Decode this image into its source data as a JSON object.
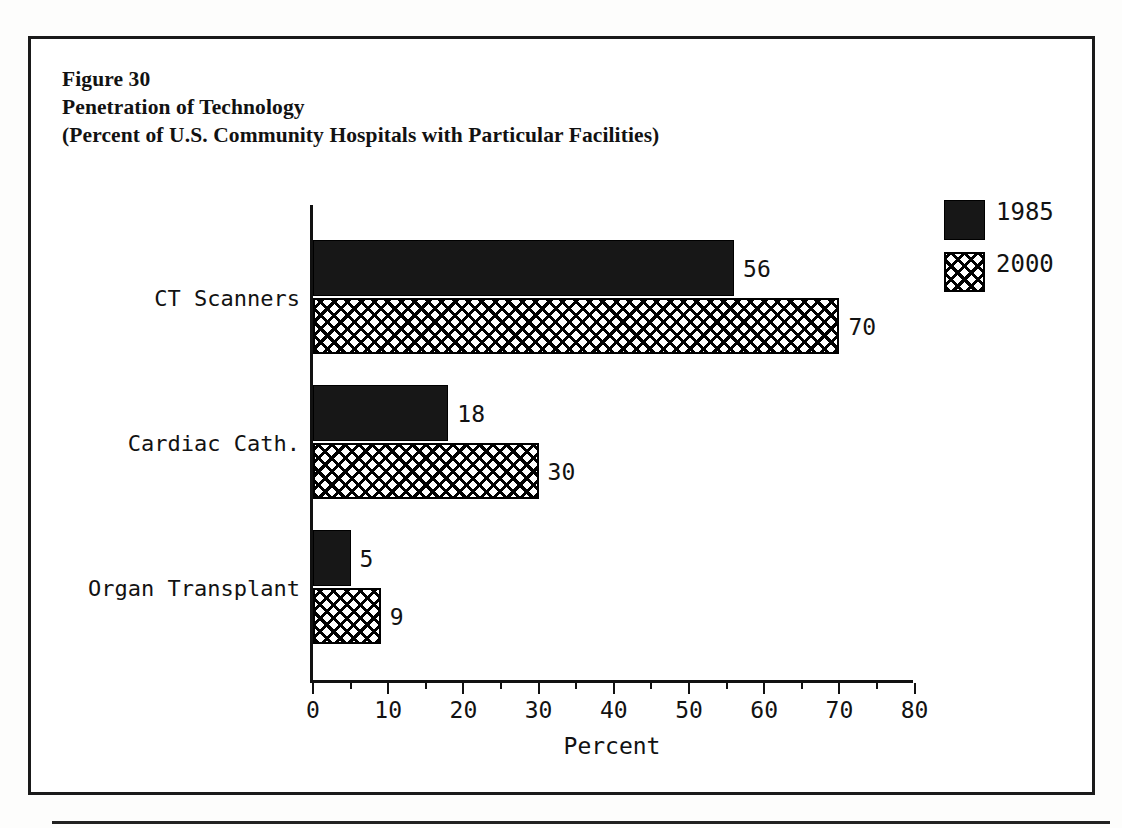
{
  "figure": {
    "title_lines": [
      "Figure 30",
      "Penetration of Technology",
      "(Percent of U.S. Community Hospitals with Particular Facilities)"
    ]
  },
  "chart_data": {
    "type": "bar",
    "orientation": "horizontal",
    "title": "Penetration of Technology",
    "subtitle": "(Percent of U.S. Community Hospitals with Particular Facilities)",
    "figure_number": "Figure 30",
    "categories": [
      "CT Scanners",
      "Cardiac Cath.",
      "Organ Transplant"
    ],
    "series": [
      {
        "name": "1985",
        "values": [
          56,
          18,
          5
        ],
        "fill": "solid-black"
      },
      {
        "name": "2000",
        "values": [
          70,
          30,
          9
        ],
        "fill": "cross-hatch"
      }
    ],
    "xlabel": "Percent",
    "ylabel": "",
    "xlim": [
      0,
      80
    ],
    "xticks": [
      0,
      10,
      20,
      30,
      40,
      50,
      60,
      70,
      80
    ],
    "xtick_labels": [
      "0",
      "10",
      "20",
      "30",
      "40",
      "50",
      "60",
      "70",
      "80"
    ],
    "minor_xticks": [
      5,
      15,
      25,
      35,
      45,
      55,
      65,
      75
    ],
    "grid": false,
    "legend_position": "top-right",
    "bar_value_labels": [
      "56",
      "70",
      "18",
      "30",
      "5",
      "9"
    ],
    "colors": {
      "series_1985": "#171717",
      "series_2000": "#ffffff",
      "outline": "#000000",
      "text": "#121212"
    }
  },
  "legend": {
    "items": [
      {
        "label": "1985",
        "swatch": "solid"
      },
      {
        "label": "2000",
        "swatch": "hatch"
      }
    ]
  },
  "axis": {
    "x_title": "Percent"
  }
}
